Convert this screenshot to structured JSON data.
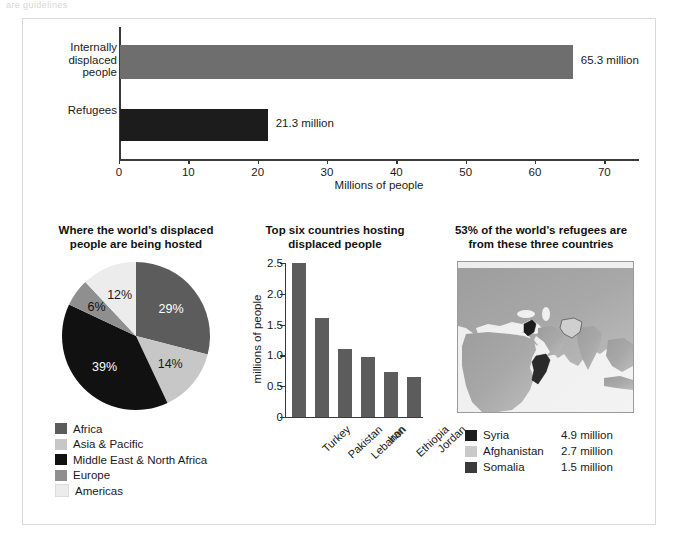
{
  "top_ghost_text": "are guidelines",
  "top_chart": {
    "xlabel": "Millions of people",
    "categories": [
      "Internally\ndisplaced\npeople",
      "Refugees"
    ],
    "values": [
      65.3,
      21.3
    ],
    "value_labels": [
      "65.3 million",
      "21.3 million"
    ],
    "xticks": [
      0,
      10,
      20,
      30,
      40,
      50,
      60,
      70
    ],
    "xtick_labels": [
      "0",
      "10",
      "20",
      "30",
      "40",
      "50",
      "60",
      "70"
    ],
    "xlim": [
      0,
      75
    ],
    "colors": [
      "#6e6e6e",
      "#1c1c1c"
    ]
  },
  "pie_panel": {
    "title": "Where the world’s displaced\npeople are being hosted",
    "legend": [
      {
        "label": "Africa",
        "color": "#5c5c5c"
      },
      {
        "label": "Asia & Pacific",
        "color": "#c7c7c7"
      },
      {
        "label": "Middle East & North Africa",
        "color": "#111111"
      },
      {
        "label": "Europe",
        "color": "#8f8f8f"
      },
      {
        "label": "Americas",
        "color": "#ececec"
      }
    ]
  },
  "vbar_panel": {
    "title": "Top six countries hosting\ndisplaced people",
    "ylabel": "millions of people",
    "yticks": [
      0,
      0.5,
      1.0,
      1.5,
      2.0,
      2.5
    ],
    "ytick_labels": [
      "0",
      "0.5",
      "1.0",
      "1.5",
      "2.0",
      "2.5"
    ],
    "bar_color": "#5c5c5c"
  },
  "map_panel": {
    "title": "53% of the world’s refugees are\nfrom these three countries",
    "legend": [
      {
        "label": "Syria",
        "value": "4.9 million",
        "color": "#1c1c1c"
      },
      {
        "label": "Afghanistan",
        "value": "2.7 million",
        "color": "#c9c9c9"
      },
      {
        "label": "Somalia",
        "value": "1.5 million",
        "color": "#3a3a3a"
      }
    ]
  },
  "chart_data": [
    {
      "type": "bar",
      "orientation": "horizontal",
      "title": "",
      "categories": [
        "Internally displaced people",
        "Refugees"
      ],
      "values": [
        65.3,
        21.3
      ],
      "data_labels": [
        "65.3 million",
        "21.3 million"
      ],
      "xlabel": "Millions of people",
      "ylabel": "",
      "xlim": [
        0,
        75
      ],
      "xticks": [
        0,
        10,
        20,
        30,
        40,
        50,
        60,
        70
      ],
      "grid": false,
      "legend": "none",
      "colors": [
        "#6e6e6e",
        "#1c1c1c"
      ]
    },
    {
      "type": "pie",
      "title": "Where the world’s displaced people are being hosted",
      "categories": [
        "Africa",
        "Asia & Pacific",
        "Middle East & North Africa",
        "Europe",
        "Americas"
      ],
      "values": [
        29,
        14,
        39,
        6,
        12
      ],
      "data_labels": [
        "29%",
        "14%",
        "39%",
        "6%",
        "12%"
      ],
      "unit": "percent",
      "legend": "bottom-left",
      "colors": [
        "#5c5c5c",
        "#c7c7c7",
        "#111111",
        "#8f8f8f",
        "#ececec"
      ]
    },
    {
      "type": "bar",
      "orientation": "vertical",
      "title": "Top six countries hosting displaced people",
      "categories": [
        "Turkey",
        "Pakistan",
        "Lebanon",
        "Iran",
        "Ethiopia",
        "Jordan"
      ],
      "values": [
        2.5,
        1.6,
        1.1,
        0.98,
        0.73,
        0.65
      ],
      "xlabel": "",
      "ylabel": "millions of people",
      "ylim": [
        0,
        2.5
      ],
      "yticks": [
        0,
        0.5,
        1.0,
        1.5,
        2.0,
        2.5
      ],
      "grid": false,
      "legend": "none",
      "colors": [
        "#5c5c5c"
      ]
    },
    {
      "type": "table",
      "title": "53% of the world’s refugees are from these three countries",
      "columns": [
        "Country",
        "Refugees"
      ],
      "rows": [
        [
          "Syria",
          "4.9 million"
        ],
        [
          "Afghanistan",
          "2.7 million"
        ],
        [
          "Somalia",
          "1.5 million"
        ]
      ],
      "annotation": "53%"
    }
  ]
}
